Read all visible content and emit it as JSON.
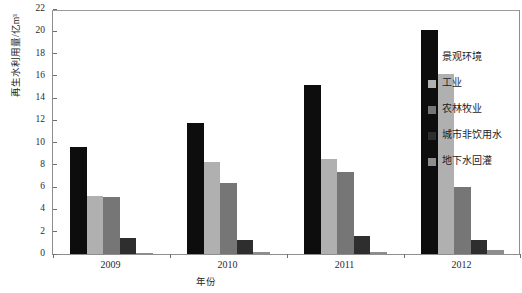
{
  "chart_data": {
    "type": "bar",
    "title": "",
    "subtitle": "",
    "xlabel": "年份",
    "ylabel": "再生水利用量/亿m³",
    "categories": [
      "2009",
      "2010",
      "2011",
      "2012"
    ],
    "ylim": [
      0,
      22
    ],
    "yticks": [
      0,
      2,
      4,
      6,
      8,
      10,
      12,
      14,
      16,
      18,
      20,
      22
    ],
    "ytick_labels": [
      "0",
      "2",
      "4",
      "6",
      "8",
      "10",
      "12",
      "14",
      "16",
      "18",
      "20",
      "22"
    ],
    "grid": false,
    "legend_position": "right",
    "series": [
      {
        "name": "景观环境",
        "color": "#0d0d0d",
        "values": [
          9.6,
          11.8,
          15.2,
          20.1
        ]
      },
      {
        "name": "工业",
        "color": "#b0b0b0",
        "values": [
          5.2,
          8.3,
          8.5,
          16.2
        ]
      },
      {
        "name": "农林牧业",
        "color": "#767676",
        "values": [
          5.1,
          6.4,
          7.4,
          6.0
        ]
      },
      {
        "name": "城市非饮用水",
        "color": "#2e2e2e",
        "values": [
          1.4,
          1.3,
          1.6,
          1.3
        ]
      },
      {
        "name": "地下水回灌",
        "color": "#8d8d8d",
        "values": [
          0.1,
          0.15,
          0.2,
          0.4
        ]
      }
    ]
  },
  "axes": {
    "y_title": "再生水利用量/亿m³",
    "x_title": "年份"
  },
  "legend": {
    "items": [
      {
        "label": "景观环境"
      },
      {
        "label": "工业"
      },
      {
        "label": "农林牧业"
      },
      {
        "label": "城市非饮用水"
      },
      {
        "label": "地下水回灌"
      }
    ]
  },
  "colors": {
    "background": "#ffffff",
    "frame": "#8e8e8e",
    "text": "#2b2b2b"
  }
}
